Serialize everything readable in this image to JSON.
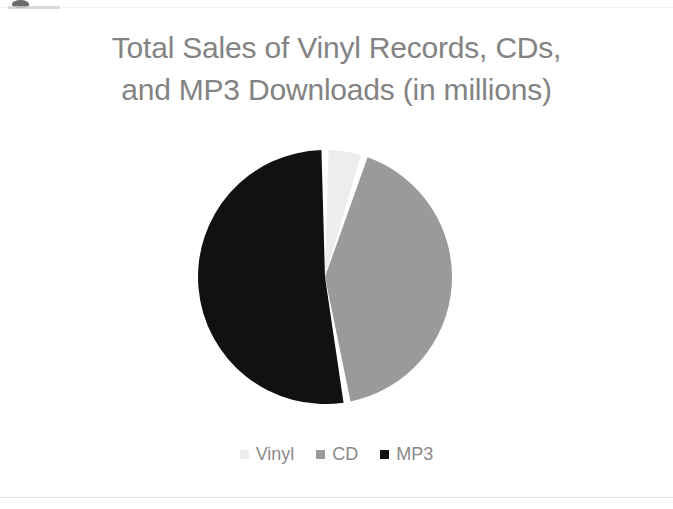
{
  "figure": {
    "background": "#ffffff",
    "title_color": "#838383",
    "legend_text_color": "#8a8a8a"
  },
  "title": {
    "line1": "Total Sales of Vinyl Records, CDs,",
    "line2": "and MP3 Downloads (in millions)"
  },
  "legend": {
    "items": [
      {
        "label": "Vinyl",
        "color": "#ededed"
      },
      {
        "label": "CD",
        "color": "#9a9a9a"
      },
      {
        "label": "MP3",
        "color": "#111111"
      }
    ]
  },
  "chart_data": {
    "type": "pie",
    "title": "Total Sales of Vinyl Records, CDs, and MP3 Downloads (in millions)",
    "xlabel": "",
    "ylabel": "",
    "unit": "millions",
    "categories": [
      "Vinyl",
      "CD",
      "MP3"
    ],
    "values": [
      5,
      42,
      53
    ],
    "percentages": [
      5,
      42,
      53
    ],
    "colors": [
      "#ededed",
      "#9a9a9a",
      "#111111"
    ],
    "start_angle_deg": 0,
    "direction": "clockwise",
    "slice_gap": true,
    "legend_position": "bottom",
    "grid": false,
    "data_labels": false,
    "slices": [
      {
        "name": "Vinyl",
        "value": 5,
        "percent": 5,
        "color": "#ededed",
        "start_deg": 0,
        "end_deg": 18
      },
      {
        "name": "CD",
        "value": 42,
        "percent": 42,
        "color": "#9a9a9a",
        "start_deg": 18,
        "end_deg": 170
      },
      {
        "name": "MP3",
        "value": 53,
        "percent": 53,
        "color": "#111111",
        "start_deg": 170,
        "end_deg": 360
      }
    ]
  },
  "geometry": {
    "center_x": 325,
    "center_y": 277,
    "radius": 127
  }
}
